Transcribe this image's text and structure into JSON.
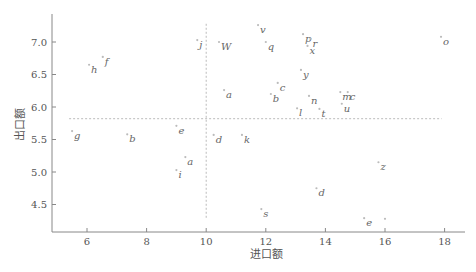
{
  "chart_data": {
    "type": "scatter",
    "title": "",
    "xlabel": "进口额",
    "ylabel": "出口额",
    "xlim": [
      5.2,
      18.6
    ],
    "ylim": [
      4.1,
      7.5
    ],
    "xticks": [
      6,
      8,
      10,
      12,
      14,
      16,
      18
    ],
    "yticks": [
      4.5,
      5.0,
      5.5,
      6.0,
      6.5,
      7.0
    ],
    "ytick_labels": [
      "4.5",
      "5.0",
      "5.5",
      "6.0",
      "6.5",
      "7.0"
    ],
    "grid": false,
    "legend": null,
    "reference_lines": {
      "vertical_x": 10.0,
      "vertical_y_range": [
        4.28,
        7.28
      ],
      "horizontal_y": 5.82,
      "horizontal_x_range": [
        5.4,
        17.9
      ]
    },
    "points": [
      {
        "label": "h",
        "x": 6.07,
        "y": 6.65
      },
      {
        "label": "f",
        "x": 6.53,
        "y": 6.77
      },
      {
        "label": "j",
        "x": 9.7,
        "y": 7.03
      },
      {
        "label": "W",
        "x": 10.43,
        "y": 7.0
      },
      {
        "label": "v",
        "x": 11.74,
        "y": 7.26
      },
      {
        "label": "q",
        "x": 12.0,
        "y": 7.0
      },
      {
        "label": "p",
        "x": 13.25,
        "y": 7.12
      },
      {
        "label": "r",
        "x": 13.5,
        "y": 7.05
      },
      {
        "label": "x",
        "x": 13.4,
        "y": 6.94
      },
      {
        "label": "o",
        "x": 17.88,
        "y": 7.08
      },
      {
        "label": "y",
        "x": 13.18,
        "y": 6.57
      },
      {
        "label": "c",
        "x": 12.4,
        "y": 6.37
      },
      {
        "label": "a",
        "x": 10.6,
        "y": 6.26
      },
      {
        "label": "b",
        "x": 12.17,
        "y": 6.2
      },
      {
        "label": "n",
        "x": 13.45,
        "y": 6.17
      },
      {
        "label": "m",
        "x": 14.5,
        "y": 6.23
      },
      {
        "label": "c",
        "x": 14.75,
        "y": 6.23
      },
      {
        "label": "u",
        "x": 14.55,
        "y": 6.05
      },
      {
        "label": "l",
        "x": 13.05,
        "y": 5.98
      },
      {
        "label": "t",
        "x": 13.8,
        "y": 5.97
      },
      {
        "label": "g",
        "x": 5.5,
        "y": 5.63
      },
      {
        "label": "b",
        "x": 7.35,
        "y": 5.58
      },
      {
        "label": "e",
        "x": 9.0,
        "y": 5.71
      },
      {
        "label": "d",
        "x": 10.25,
        "y": 5.57
      },
      {
        "label": "k",
        "x": 11.2,
        "y": 5.57
      },
      {
        "label": "a",
        "x": 9.3,
        "y": 5.23
      },
      {
        "label": "i",
        "x": 9.0,
        "y": 5.03
      },
      {
        "label": "z",
        "x": 15.78,
        "y": 5.15
      },
      {
        "label": "d",
        "x": 13.7,
        "y": 4.75
      },
      {
        "label": "s",
        "x": 11.85,
        "y": 4.43
      },
      {
        "label": "e",
        "x": 15.3,
        "y": 4.29
      },
      {
        "label": "",
        "x": 16.0,
        "y": 4.28
      }
    ]
  }
}
